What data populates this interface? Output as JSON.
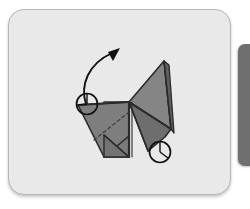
{
  "page": {
    "background_color": "#ffffff",
    "width": 250,
    "height": 209
  },
  "card": {
    "name": "origami-step-card",
    "background_color": "#e9e9e9",
    "border_color": "#b6b6b6",
    "corner_radius": 16
  },
  "side_panel": {
    "name": "adjacent-panel-sliver",
    "color": "#6f6f6f"
  },
  "diagram": {
    "title": "Origami folding step diagram",
    "paper_fill_light": "#8a8a8a",
    "paper_fill_mid": "#7a7a7a",
    "paper_fill_dark": "#6a6a6a",
    "outline_color": "#2b2b2b",
    "fold_line_color": "#3a3a3a",
    "dashed_fold_color": "#4a4a4a",
    "arrow_color": "#111111",
    "marker_color": "#111111",
    "shapes": [
      {
        "name": "head-triangle",
        "fill": "#7e7e7e"
      },
      {
        "name": "neck-panel",
        "fill": "#808080"
      },
      {
        "name": "body-square",
        "fill": "#7b7b7b"
      },
      {
        "name": "tail-upper-wedge",
        "fill": "#858585"
      },
      {
        "name": "tail-lower-wedge",
        "fill": "#6e6e6e"
      },
      {
        "name": "tail-spine-strip",
        "fill": "#5f5f5f"
      }
    ],
    "annotations": [
      {
        "name": "rotation-arrow",
        "type": "curved-arrow",
        "direction": "up-right",
        "label": ""
      },
      {
        "name": "reference-marker-head",
        "type": "circle-marker",
        "label": ""
      },
      {
        "name": "reference-marker-foot",
        "type": "circle-marker",
        "label": ""
      }
    ]
  }
}
